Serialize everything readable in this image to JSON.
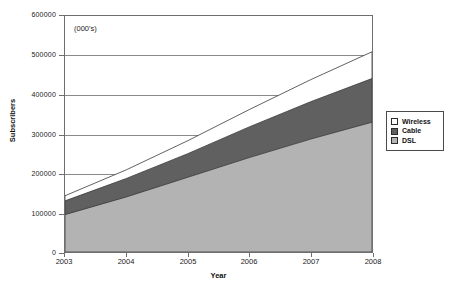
{
  "chart_data": {
    "type": "area",
    "stacked": true,
    "title": "",
    "annotation": "(000's)",
    "xlabel": "Year",
    "ylabel": "Subscribers",
    "categories": [
      "2003",
      "2004",
      "2005",
      "2006",
      "2007",
      "2008"
    ],
    "x": [
      2003,
      2004,
      2005,
      2006,
      2007,
      2008
    ],
    "xlim": [
      2003,
      2008
    ],
    "ylim": [
      0,
      600000
    ],
    "ytick_labels": [
      "0",
      "100000",
      "200000",
      "300000",
      "400000",
      "500000",
      "600000"
    ],
    "ytick_values": [
      0,
      100000,
      200000,
      300000,
      400000,
      500000,
      600000
    ],
    "grid": true,
    "legend_position": "right",
    "series": [
      {
        "name": "DSL",
        "color": "#b3b3b3",
        "values": [
          95000,
          140000,
          190000,
          240000,
          287000,
          330000
        ],
        "cumulative_top": [
          95000,
          140000,
          190000,
          240000,
          287000,
          330000
        ]
      },
      {
        "name": "Cable",
        "color": "#606060",
        "values": [
          35000,
          47000,
          60000,
          78000,
          95000,
          111000
        ],
        "cumulative_top": [
          130000,
          187000,
          250000,
          318000,
          382000,
          441000
        ]
      },
      {
        "name": "Wireless",
        "color": "#ffffff",
        "values": [
          13000,
          22000,
          33000,
          44000,
          56000,
          68000
        ],
        "cumulative_top": [
          143000,
          209000,
          283000,
          362000,
          438000,
          509000
        ]
      }
    ]
  },
  "legend": {
    "items": [
      {
        "label": "Wireless",
        "color": "#ffffff"
      },
      {
        "label": "Cable",
        "color": "#606060"
      },
      {
        "label": "DSL",
        "color": "#b3b3b3"
      }
    ]
  },
  "axes": {
    "y_title": "Subscribers",
    "x_title": "Year"
  }
}
